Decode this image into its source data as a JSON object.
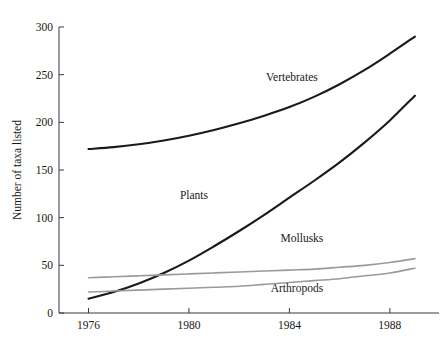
{
  "chart_data": {
    "type": "line",
    "title": "",
    "subtitle": "",
    "xlabel": "",
    "ylabel": "Number of taxa listed",
    "xlim": [
      1975.6,
      1989.4
    ],
    "ylim": [
      0,
      300
    ],
    "grid": false,
    "legend_position": "inline-annotations",
    "x_ticks": [
      1976,
      1980,
      1984,
      1988
    ],
    "x_tick_labels": [
      "1976",
      "1980",
      "1984",
      "1988"
    ],
    "y_ticks": [
      0,
      50,
      100,
      150,
      200,
      250,
      300
    ],
    "y_tick_labels": [
      "0",
      "50",
      "100",
      "150",
      "200",
      "250",
      "300"
    ],
    "x": [
      1976,
      1977,
      1978,
      1979,
      1980,
      1981,
      1982,
      1983,
      1984,
      1985,
      1986,
      1987,
      1988,
      1989
    ],
    "series": [
      {
        "name": "Vertebrates",
        "color": "#1a1a1a",
        "width": 2.1,
        "values": [
          172,
          174,
          177,
          181,
          186,
          192,
          199,
          207,
          216,
          227,
          240,
          255,
          272,
          290
        ],
        "label_x": 1984.1,
        "label_y": 243
      },
      {
        "name": "Plants",
        "color": "#1a1a1a",
        "width": 2.1,
        "values": [
          15,
          22,
          31,
          42,
          55,
          70,
          86,
          103,
          121,
          139,
          158,
          179,
          202,
          228
        ],
        "label_x": 1980.2,
        "label_y": 120
      },
      {
        "name": "Mollusks",
        "color": "#9a9a9a",
        "width": 1.6,
        "values": [
          37,
          38,
          39,
          40,
          41,
          42,
          43,
          44,
          45,
          46,
          48,
          50,
          53,
          57
        ],
        "label_x": 1984.5,
        "label_y": 74
      },
      {
        "name": "Arthropods",
        "color": "#9a9a9a",
        "width": 1.6,
        "values": [
          22,
          23,
          24,
          25,
          26,
          27,
          28,
          30,
          32,
          34,
          36,
          39,
          42,
          47
        ],
        "label_x": 1984.3,
        "label_y": 22
      }
    ]
  },
  "axes": {
    "y_axis_title": "Number of taxa listed"
  },
  "colors": {
    "dark_series": "#1a1a1a",
    "gray_series": "#9a9a9a",
    "axis": "#3b3b3b",
    "background": "#ffffff"
  }
}
